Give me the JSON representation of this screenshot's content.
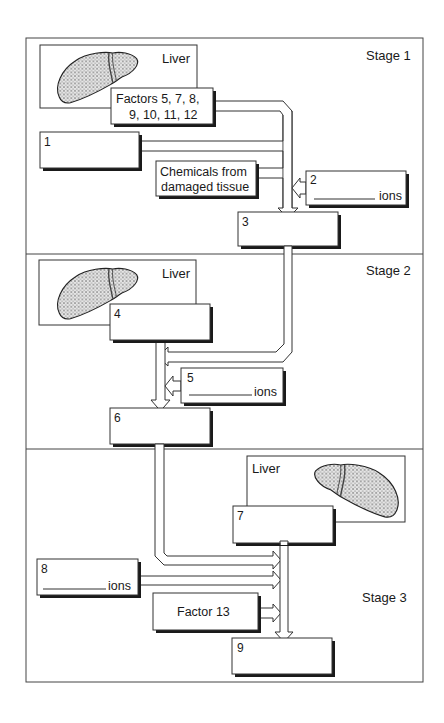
{
  "diagram": {
    "type": "blood clotting cascade worksheet",
    "stages": [
      {
        "label": "Stage 1"
      },
      {
        "label": "Stage 2"
      },
      {
        "label": "Stage 3"
      }
    ],
    "liver_label": "Liver",
    "boxes": {
      "factors": {
        "line1": "Factors 5, 7, 8,",
        "line2": "9, 10, 11, 12"
      },
      "b1": {
        "number": "1"
      },
      "chemicals": {
        "line1": "Chemicals from",
        "line2": "damaged tissue"
      },
      "b2": {
        "number": "2",
        "suffix": "ions"
      },
      "b3": {
        "number": "3"
      },
      "b4": {
        "number": "4"
      },
      "b5": {
        "number": "5",
        "suffix": "ions"
      },
      "b6": {
        "number": "6"
      },
      "b7": {
        "number": "7"
      },
      "b8": {
        "number": "8",
        "suffix": "ions"
      },
      "factor13": {
        "label": "Factor 13"
      },
      "b9": {
        "number": "9"
      }
    },
    "colors": {
      "line": "#333333",
      "shadow": "#1a1a1a",
      "liver": "#9a9a9a",
      "background": "#ffffff"
    }
  }
}
